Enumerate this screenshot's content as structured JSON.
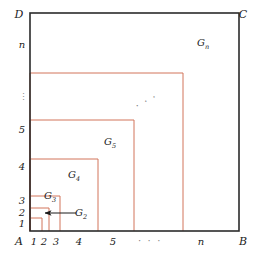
{
  "figure": {
    "background_color": "#ffffff",
    "outer_square": {
      "stroke_color": "#2b2b2b",
      "stroke_width": 1.6,
      "left": 30,
      "right": 239,
      "top": 13,
      "bottom": 231
    },
    "nested_stroke_color": "#d2745a",
    "nested_stroke_width": 1.0,
    "arrow_color": "#1b1b1b"
  },
  "corners": [
    {
      "name": "corner-D",
      "label": "D",
      "x": 19,
      "y": 18
    },
    {
      "name": "corner-C",
      "label": "C",
      "x": 243,
      "y": 18
    },
    {
      "name": "corner-A",
      "label": "A",
      "x": 19,
      "y": 245
    },
    {
      "name": "corner-B",
      "label": "B",
      "x": 243,
      "y": 245
    }
  ],
  "y_axis": {
    "name": "y-axis-ticks",
    "ticks": [
      {
        "label": "1",
        "value": 1,
        "x": 22,
        "y": 227
      },
      {
        "label": "2",
        "value": 2,
        "x": 22,
        "y": 216
      },
      {
        "label": "3",
        "value": 3,
        "x": 22,
        "y": 204
      },
      {
        "label": "4",
        "value": 4,
        "x": 22,
        "y": 170
      },
      {
        "label": "5",
        "value": 5,
        "x": 22,
        "y": 133
      },
      {
        "label": "n",
        "value": null,
        "x": 22,
        "y": 48
      }
    ],
    "ellipsis": {
      "label": "⋮",
      "x": 23,
      "y": 100
    }
  },
  "x_axis": {
    "name": "x-axis-ticks",
    "ticks": [
      {
        "label": "1",
        "value": 1,
        "x": 34,
        "y": 245
      },
      {
        "label": "2",
        "value": 2,
        "x": 44,
        "y": 245
      },
      {
        "label": "3",
        "value": 3,
        "x": 56,
        "y": 245
      },
      {
        "label": "4",
        "value": 4,
        "x": 79,
        "y": 245
      },
      {
        "label": "5",
        "value": 5,
        "x": 113,
        "y": 245
      },
      {
        "label": "n",
        "value": null,
        "x": 201,
        "y": 245
      }
    ],
    "ellipsis": {
      "label": "· · ·",
      "x": 150,
      "y": 244
    }
  },
  "diagonal_ellipsis": {
    "name": "diagonal-dots",
    "label": "· · ·",
    "x": 148,
    "y": 104,
    "rotation": -28
  },
  "nested_rectangles": [
    {
      "name": "region-g1",
      "index": 1,
      "x_max": 42,
      "y_min": 218
    },
    {
      "name": "region-g2",
      "index": 2,
      "x_max": 49,
      "y_min": 208
    },
    {
      "name": "region-g3",
      "index": 3,
      "x_max": 60,
      "y_min": 196
    },
    {
      "name": "region-g4",
      "index": 4,
      "x_max": 98,
      "y_min": 159
    },
    {
      "name": "region-g5",
      "index": 5,
      "x_max": 134,
      "y_min": 120
    },
    {
      "name": "region-gn",
      "index": 6,
      "x_max": 183,
      "y_min": 73
    }
  ],
  "region_labels": [
    {
      "name": "label-g2",
      "base": "G",
      "sub": "2",
      "x": 81,
      "y": 216
    },
    {
      "name": "label-g3",
      "base": "G",
      "sub": "3",
      "x": 50,
      "y": 199
    },
    {
      "name": "label-g4",
      "base": "G",
      "sub": "4",
      "x": 74,
      "y": 178
    },
    {
      "name": "label-g5",
      "base": "G",
      "sub": "5",
      "x": 110,
      "y": 145
    },
    {
      "name": "label-gn",
      "base": "G",
      "sub": "n",
      "x": 203,
      "y": 46
    }
  ],
  "arrow": {
    "name": "g2-callout-arrow",
    "from_x": 76,
    "to_x": 45,
    "y": 213
  }
}
